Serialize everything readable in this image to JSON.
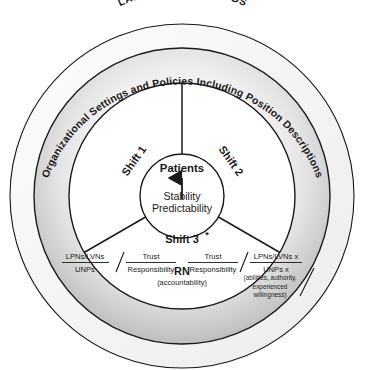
{
  "diagram": {
    "outer_title": "LAWS AND STANDARDS",
    "ring_label": "Organizational Settings and Policies Including Position Descriptions",
    "center": {
      "top_label": "Patients",
      "line1": "Stability",
      "line2": "Predictability",
      "arrow": "up-arrow-icon"
    },
    "sectors": [
      {
        "id": "shift-1",
        "label": "Shift 1"
      },
      {
        "id": "shift-2",
        "label": "Shift 2"
      },
      {
        "id": "shift-3",
        "label": "Shift 3",
        "marker": "*"
      }
    ],
    "bottom_row": {
      "left_fraction": {
        "numerator": "LPNs/LVNs",
        "denominator": "UNPs"
      },
      "left_mid_fraction": {
        "numerator": "Trust",
        "denominator": "Responsibility"
      },
      "center_node": {
        "label": "RN",
        "sub": "(accountability)"
      },
      "right_mid_fraction": {
        "numerator": "Trust",
        "denominator": "Responsibility"
      },
      "right_fraction": {
        "numerator": "LPNs/LVNs x",
        "denominator": "UNPs x"
      },
      "right_note_line1": "(abilities, authority,",
      "right_note_line2": "experienced",
      "right_note_line3": "willingness)"
    }
  },
  "colors": {
    "stroke": "#1a1a1a",
    "outer_ring_fill": "#f2f2f2",
    "mid_band_light": "#ffffff",
    "mid_band_dark": "#b9b9b9",
    "inner_fill": "#ffffff",
    "text": "#1a1a1a"
  }
}
